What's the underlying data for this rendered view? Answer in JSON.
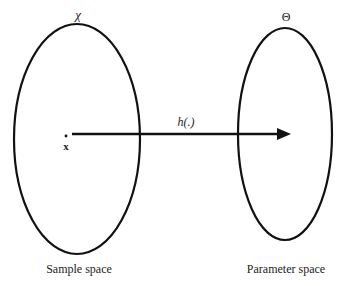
{
  "diagram": {
    "sample_space": {
      "symbol": "χ",
      "caption": "Sample space",
      "point_label": "x"
    },
    "parameter_space": {
      "symbol": "Θ",
      "caption": "Parameter space"
    },
    "mapping": {
      "label": "h(.)",
      "from": "sample_space",
      "to": "parameter_space"
    },
    "colors": {
      "stroke": "#111111",
      "text": "#222222",
      "background": "#ffffff"
    }
  }
}
